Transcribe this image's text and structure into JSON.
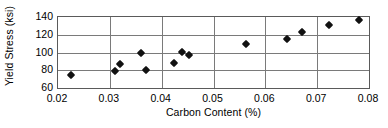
{
  "chart_data": {
    "type": "scatter",
    "title": "",
    "xlabel": "Carbon Content (%)",
    "ylabel": "Yield Stress (ksi)",
    "xlim": [
      0.02,
      0.08
    ],
    "ylim": [
      60,
      140
    ],
    "xticks": [
      0.02,
      0.03,
      0.04,
      0.05,
      0.06,
      0.07,
      0.08
    ],
    "xtick_labels": [
      "0.02",
      "0.03",
      "0.04",
      "0.05",
      "0.06",
      "0.07",
      "0.08"
    ],
    "yticks": [
      60,
      80,
      100,
      120,
      140
    ],
    "ytick_labels": [
      "60",
      "80",
      "100",
      "120",
      "140"
    ],
    "grid": true,
    "legend": false,
    "marker": "diamond",
    "marker_color": "#111111",
    "points": [
      {
        "x": 0.0225,
        "y": 75
      },
      {
        "x": 0.031,
        "y": 79
      },
      {
        "x": 0.032,
        "y": 87
      },
      {
        "x": 0.036,
        "y": 99
      },
      {
        "x": 0.037,
        "y": 80
      },
      {
        "x": 0.0423,
        "y": 88
      },
      {
        "x": 0.044,
        "y": 100.5
      },
      {
        "x": 0.0452,
        "y": 97.5
      },
      {
        "x": 0.0563,
        "y": 110
      },
      {
        "x": 0.0642,
        "y": 115
      },
      {
        "x": 0.067,
        "y": 123
      },
      {
        "x": 0.0722,
        "y": 131
      },
      {
        "x": 0.0781,
        "y": 137
      }
    ]
  }
}
